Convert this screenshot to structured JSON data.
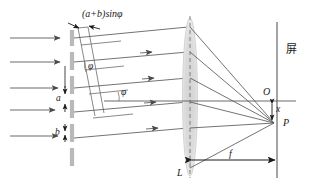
{
  "figure": {
    "width": 313,
    "height": 188,
    "background": "#ffffff",
    "stroke_color": "#4a4a4a",
    "text_color": "#1a1a1a",
    "grating_color": "#b8b8b8",
    "lens_color": "#d9d9d9"
  },
  "labels": {
    "path_difference": "(a+b)sinφ",
    "angle_upper": "φ",
    "angle_lower": "φ",
    "slit_width": "a",
    "opaque_width": "b",
    "lens": "L",
    "focal_length": "f",
    "optical_center": "O",
    "focus_point": "P",
    "offset": "x",
    "screen": "屏"
  },
  "elements": {
    "incoming_rays_count": 5,
    "diffracted_rays_count": 5,
    "grating_segments": 5,
    "screen_label_meaning": "screen"
  }
}
